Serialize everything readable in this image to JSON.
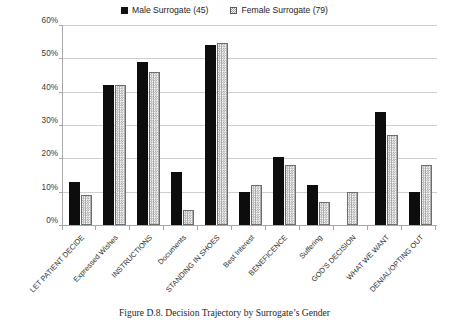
{
  "legend": {
    "position": "top-center",
    "entries": [
      {
        "label": "Male Surrogate (45)",
        "marker": "filled-square-swatch",
        "color": "#101010"
      },
      {
        "label": "Female Surrogate (79)",
        "marker": "checkered-square-swatch",
        "color": "#ffffff"
      }
    ]
  },
  "caption": "Figure D.8. Decision Trajectory by Surrogate’s Gender",
  "axis": {
    "y_ticks": [
      "0%",
      "10%",
      "20%",
      "30%",
      "40%",
      "50%",
      "60%"
    ]
  },
  "chart_data": {
    "type": "bar",
    "title": "Figure D.8. Decision Trajectory by Surrogate’s Gender",
    "xlabel": "",
    "ylabel": "",
    "ylim": [
      0,
      60
    ],
    "ytick_values": [
      0,
      10,
      20,
      30,
      40,
      50,
      60
    ],
    "ytick_labels": [
      "0%",
      "10%",
      "20%",
      "30%",
      "40%",
      "50%",
      "60%"
    ],
    "grid": true,
    "legend_position": "top-center",
    "categories": [
      "LET PATIENT DECIDE",
      "Expressed Wishes",
      "INSTRUCTIONS",
      "Documents",
      "STANDING IN SHOES",
      "Best Interest",
      "BENEFICENCE",
      "Suffering",
      "GOD'S DECISION",
      "WHAT WE WANT",
      "DENIAL/OPTING OUT"
    ],
    "series": [
      {
        "name": "Male Surrogate (45)",
        "color": "#0d0d0d",
        "values": [
          13,
          42,
          49,
          16,
          54,
          10,
          20.5,
          12,
          0,
          34,
          10
        ]
      },
      {
        "name": "Female Surrogate (79)",
        "color": "#ffffff",
        "values": [
          9,
          42,
          46,
          4.5,
          54.5,
          12,
          18,
          7,
          10,
          27,
          18
        ]
      }
    ]
  }
}
